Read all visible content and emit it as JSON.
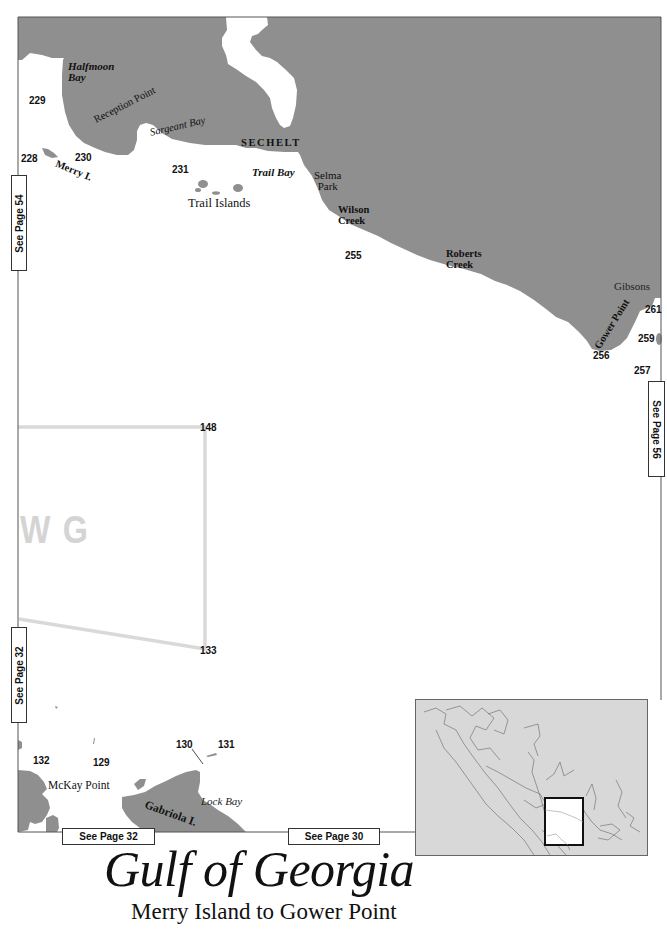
{
  "title": "Gulf of Georgia",
  "subtitle": "Merry Island to Gower Point",
  "colors": {
    "land": "#8f8f8f",
    "water": "#ffffff",
    "chart_box": "#d9d9d9",
    "inset_bg": "#d8d8d8",
    "inset_highlight": "#111111"
  },
  "place_names": {
    "halfmoon_bay": "Halfmoon Bay",
    "halfmoon_line1": "Halfmoon",
    "halfmoon_line2": "Bay",
    "reception_point": "Reception Point",
    "sargeant_bay": "Sargeant Bay",
    "merry_island": "Merry I.",
    "sechelt": "SECHELT",
    "trail_bay": "Trail Bay",
    "trail_islands": "Trail Islands",
    "selma_line1": "Selma",
    "selma_line2": "Park",
    "wilson_line1": "Wilson",
    "wilson_line2": "Creek",
    "roberts_line1": "Roberts",
    "roberts_line2": "Creek",
    "gibsons": "Gibsons",
    "gower_point": "Gower Point",
    "mckay_point": "McKay Point",
    "gabriola_island": "Gabriola I.",
    "lock_bay": "Lock Bay"
  },
  "waypoints": {
    "w228": "228",
    "w229": "229",
    "w230": "230",
    "w231": "231",
    "w255": "255",
    "w256": "256",
    "w257": "257",
    "w259": "259",
    "w261": "261",
    "w148": "148",
    "w133": "133",
    "w132": "132",
    "w129": "129",
    "w130": "130",
    "w131": "131"
  },
  "chart_area_label": "W G",
  "see_page": {
    "left_top": "See Page 54",
    "left_bottom": "See Page 32",
    "right": "See Page 56",
    "bottom_left": "See Page 32",
    "bottom_right": "See Page 30"
  }
}
